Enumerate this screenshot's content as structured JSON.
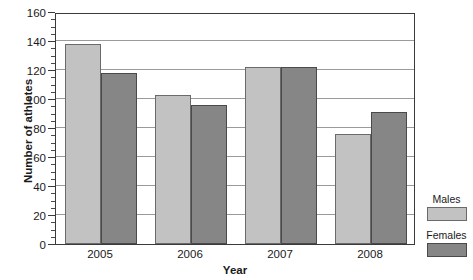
{
  "chart_data": {
    "type": "bar",
    "title": "",
    "xlabel": "Year",
    "ylabel": "Number of athletes",
    "categories": [
      "2005",
      "2006",
      "2007",
      "2008"
    ],
    "series": [
      {
        "name": "Males",
        "values": [
          138,
          103,
          122,
          76
        ],
        "color": "#c2c2c2"
      },
      {
        "name": "Females",
        "values": [
          118,
          96,
          122,
          91
        ],
        "color": "#868686"
      }
    ],
    "ylim": [
      0,
      160
    ],
    "y_major_ticks": [
      0,
      20,
      40,
      60,
      80,
      100,
      120,
      140,
      160
    ],
    "y_tick_labels": [
      "0",
      "20",
      "40",
      "60",
      "80",
      "100",
      "120",
      "140",
      "160"
    ],
    "y_minor_tick_step": 5,
    "grid": true,
    "grid_axis": "y",
    "legend_position": "right"
  },
  "axes": {
    "y_title": "Number of athletes",
    "x_title": "Year"
  },
  "legend": {
    "entries": [
      {
        "label": "Males",
        "swatch": "light-gray-swatch"
      },
      {
        "label": "Females",
        "swatch": "dark-gray-swatch"
      }
    ]
  }
}
